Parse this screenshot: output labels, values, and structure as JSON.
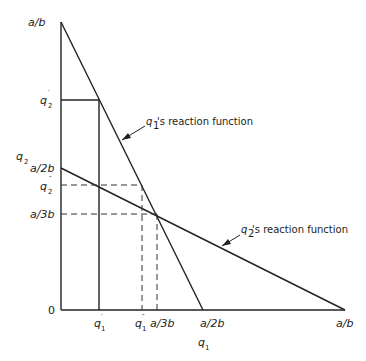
{
  "diagram": {
    "type": "reaction-function-diagram",
    "axes": {
      "x_label": "q",
      "x_label_sub": "1",
      "y_label": "q",
      "y_label_sub": "2",
      "origin_label": "0"
    },
    "y_ticks": [
      {
        "label": "a/b",
        "y": 22
      },
      {
        "label": "q",
        "sub": "2",
        "prime": "′",
        "y": 100
      },
      {
        "label": "a/2b",
        "y": 168
      },
      {
        "label": "q",
        "sub": "2",
        "prime": "″",
        "y": 185
      },
      {
        "label": "a/3b",
        "y": 214
      }
    ],
    "x_ticks": [
      {
        "label": "q",
        "sub": "1",
        "prime": "′",
        "x": 99
      },
      {
        "label": "q",
        "sub": "1",
        "prime": "″",
        "x": 142
      },
      {
        "label": "a/3b",
        "x": 157
      },
      {
        "label": "a/2b",
        "x": 203
      },
      {
        "label": "a/b",
        "x": 345
      }
    ],
    "annotations": {
      "q1_reaction": {
        "prefix": "q",
        "sub": "1",
        "text": "'s reaction function"
      },
      "q2_reaction": {
        "prefix": "q",
        "sub": "2",
        "text": "'s reaction function"
      }
    },
    "lines": [
      {
        "name": "q1-reaction-function",
        "from": "(0, a/b)",
        "to": "(a/2b, 0)"
      },
      {
        "name": "q2-reaction-function",
        "from": "(0, a/2b)",
        "to": "(a/b, 0)"
      }
    ],
    "equilibrium": {
      "q1": "a/3b",
      "q2": "a/3b"
    }
  }
}
